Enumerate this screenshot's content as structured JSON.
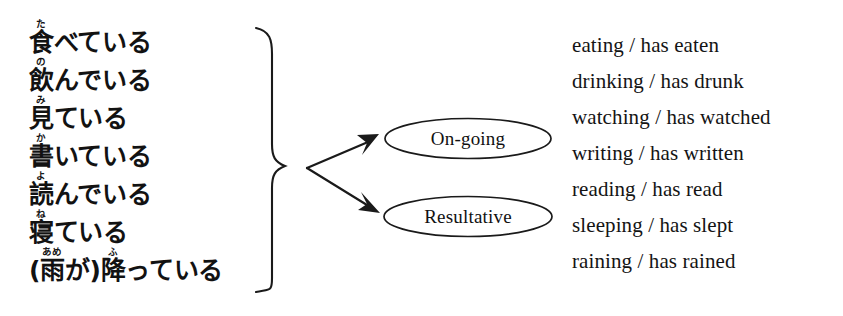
{
  "figure": {
    "type": "linguistic-branching-diagram",
    "background_color": "#ffffff",
    "text_color": "#111111"
  },
  "japanese_forms": [
    {
      "base": "食",
      "ruby": "た",
      "rest": "べている",
      "plain": "食べている"
    },
    {
      "base": "飲",
      "ruby": "の",
      "rest": "んでいる",
      "plain": "飲んでいる"
    },
    {
      "base": "見",
      "ruby": "み",
      "rest": "ている",
      "plain": "見ている"
    },
    {
      "base": "書",
      "ruby": "か",
      "rest": "いている",
      "plain": "書いている"
    },
    {
      "base": "読",
      "ruby": "よ",
      "rest": "んでいる",
      "plain": "読んでいる"
    },
    {
      "base": "寝",
      "ruby": "ね",
      "rest": "ている",
      "plain": "寝ている"
    },
    {
      "prefix": "(",
      "base": "雨",
      "ruby": "あめ",
      "mid": "が)",
      "base2": "降",
      "ruby2": "ふ",
      "rest": "っている",
      "plain": "(雨が)降っている"
    }
  ],
  "nodes": [
    {
      "id": "on-going",
      "label": "On-going"
    },
    {
      "id": "resultative",
      "label": "Resultative"
    }
  ],
  "english_glosses": [
    "eating / has eaten",
    "drinking / has drunk",
    "watching / has watched",
    "writing / has written",
    "reading / has read",
    "sleeping / has slept",
    "raining / has rained"
  ]
}
